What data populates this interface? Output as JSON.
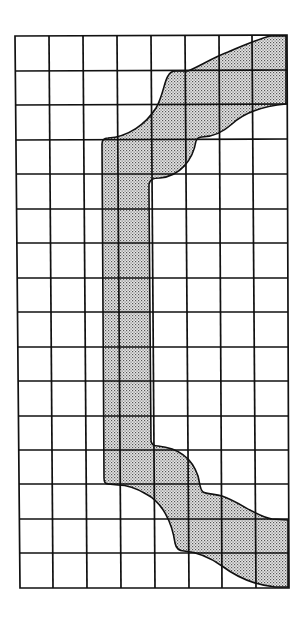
{
  "figure": {
    "title": "",
    "grid": {
      "columns": 8,
      "rows": 16,
      "line_color": "#111111",
      "background": "#ffffff",
      "bounds": {
        "left": 17,
        "top": 36,
        "right": 287,
        "bottom": 587
      }
    },
    "shape": {
      "name": "shaded-bracket-region",
      "fill_color": "#c8c8c8",
      "dot_color": "#555555",
      "outline_color": "#111111",
      "segments": [
        {
          "name": "upper-arm",
          "description": "curved band from vertical bar to top-right corner"
        },
        {
          "name": "vertical-bar",
          "description": "vertical stem spanning middle rows"
        },
        {
          "name": "lower-arm",
          "description": "curved band from vertical bar to bottom-right corner"
        }
      ]
    }
  }
}
